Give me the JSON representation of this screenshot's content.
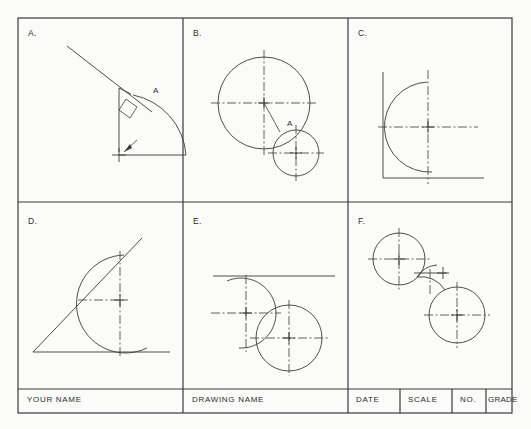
{
  "sheet": {
    "background_color": "#fbfbf9",
    "line_color": "#3a3a3a",
    "frame": {
      "x": 18,
      "y": 18,
      "width": 494,
      "height": 395
    }
  },
  "panels": [
    {
      "id": "panel-a",
      "label": "A.",
      "label_x": 28,
      "label_y": 32,
      "annotation": "A",
      "annotation_x": 155,
      "annotation_y": 93,
      "description": "Line tangent to arc with perpendicular marker at tangent point A"
    },
    {
      "id": "panel-b",
      "label": "B.",
      "label_x": 193,
      "label_y": 32,
      "annotation": "A",
      "annotation_x": 289,
      "annotation_y": 126,
      "description": "Large circle with small circle tangent at point A"
    },
    {
      "id": "panel-c",
      "label": "C.",
      "label_x": 358,
      "label_y": 32,
      "annotation": "",
      "description": "Arc tangent to vertical and horizontal lines"
    },
    {
      "id": "panel-d",
      "label": "D.",
      "label_x": 28,
      "label_y": 222,
      "annotation": "",
      "description": "Arc tangent to an inclined line and a horizontal baseline"
    },
    {
      "id": "panel-e",
      "label": "E.",
      "label_x": 193,
      "label_y": 222,
      "annotation": "",
      "description": "Arc tangent to horizontal line and tangent to a circle"
    },
    {
      "id": "panel-f",
      "label": "F.",
      "label_x": 358,
      "label_y": 222,
      "annotation": "",
      "description": "Reverse curve connecting two circles"
    }
  ],
  "title_block": {
    "top_y": 389,
    "bottom_y": 413,
    "cells": [
      {
        "id": "your-name",
        "label": "YOUR  NAME",
        "x": 18,
        "width": 165,
        "text_x": 27,
        "text_y": 397
      },
      {
        "id": "drawing-name",
        "label": "DRAWING  NAME",
        "x": 183,
        "width": 165,
        "text_x": 192,
        "text_y": 397
      },
      {
        "id": "date",
        "label": "DATE",
        "x": 348,
        "width": 52,
        "text_x": 356,
        "text_y": 397
      },
      {
        "id": "scale",
        "label": "SCALE",
        "x": 400,
        "width": 52,
        "text_x": 408,
        "text_y": 397
      },
      {
        "id": "number",
        "label": "NO.",
        "x": 452,
        "width": 34,
        "text_x": 460,
        "text_y": 397
      },
      {
        "id": "grade",
        "label": "GRADE",
        "x": 486,
        "width": 26,
        "text_x": 488,
        "text_y": 397
      }
    ]
  },
  "grid": {
    "vertical_dividers": [
      183,
      348
    ],
    "horizontal_dividers": [
      202,
      389
    ]
  }
}
